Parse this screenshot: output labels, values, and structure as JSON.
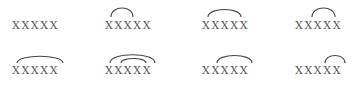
{
  "diagram": {
    "type": "arc-patterns",
    "colors": {
      "text": "#555555",
      "arc": "#444444",
      "background": "#ffffff"
    },
    "groups": [
      {
        "label": "XXXXX",
        "arcs": []
      },
      {
        "label": "XXXXX",
        "arcs": [
          {
            "from": 1,
            "to": 2
          }
        ]
      },
      {
        "label": "XXXXX",
        "arcs": [
          {
            "from": 1,
            "to": 4
          }
        ]
      },
      {
        "label": "XXXXX",
        "arcs": [
          {
            "from": 3,
            "to": 4
          }
        ]
      },
      {
        "label": "XXXXX",
        "arcs": [
          {
            "from": 1,
            "to": 5
          }
        ]
      },
      {
        "label": "XXXXX",
        "arcs": [
          {
            "from": 1,
            "to": 5
          },
          {
            "from": 2,
            "to": 4
          }
        ]
      },
      {
        "label": "XXXXX",
        "arcs": [
          {
            "from": 2,
            "to": 5
          }
        ]
      },
      {
        "label": "XXXXX",
        "arcs": [
          {
            "from": 4,
            "to": 5
          }
        ]
      }
    ]
  }
}
